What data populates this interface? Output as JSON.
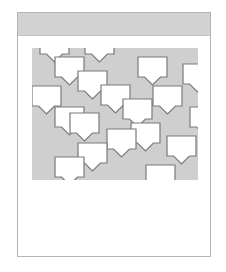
{
  "colors": {
    "frame_border": "#b4b4b4",
    "header_bg": "#d2d2d2",
    "canvas_bg": "#cfcfcf",
    "bubble_fill": "#ffffff",
    "bubble_stroke": "#7a7a7a"
  },
  "bubble": {
    "width": 29,
    "height": 20,
    "tail_w": 16,
    "tail_h": 8
  },
  "bubbles": [
    {
      "x": 8,
      "y": -14
    },
    {
      "x": 53,
      "y": -14
    },
    {
      "x": 23,
      "y": 9
    },
    {
      "x": 46,
      "y": 23
    },
    {
      "x": 106,
      "y": 9
    },
    {
      "x": 151,
      "y": 16
    },
    {
      "x": 0,
      "y": 38
    },
    {
      "x": 69,
      "y": 37
    },
    {
      "x": 121,
      "y": 38
    },
    {
      "x": 91,
      "y": 51
    },
    {
      "x": 23,
      "y": 59
    },
    {
      "x": 38,
      "y": 65
    },
    {
      "x": 158,
      "y": 59
    },
    {
      "x": 99,
      "y": 75
    },
    {
      "x": 75,
      "y": 81
    },
    {
      "x": 46,
      "y": 95
    },
    {
      "x": 135,
      "y": 88
    },
    {
      "x": 23,
      "y": 109
    },
    {
      "x": 114,
      "y": 117
    }
  ]
}
